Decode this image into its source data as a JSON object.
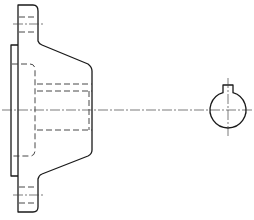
{
  "drawing": {
    "title": "",
    "views": [
      {
        "name": "side-section-view",
        "description": "flange with tapered hub, hidden bore lines"
      },
      {
        "name": "end-view",
        "description": "circular shaft section with keyway"
      }
    ],
    "colors": {
      "line": "#1a1a1a",
      "background": "#ffffff"
    }
  }
}
